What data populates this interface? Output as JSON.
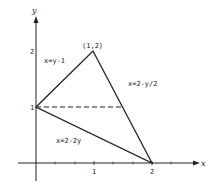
{
  "diagram": {
    "type": "region-plot",
    "axes": {
      "x_label": "x",
      "y_label": "y",
      "x_ticks": [
        "1",
        "2"
      ],
      "y_ticks": [
        "1",
        "2"
      ]
    },
    "vertices": {
      "apex": {
        "label": "(1,2)",
        "x": 1,
        "y": 2
      },
      "left": {
        "x": 0,
        "y": 1
      },
      "right": {
        "x": 2,
        "y": 0
      }
    },
    "curves": [
      {
        "label": "x=y-1",
        "from": [
          0,
          1
        ],
        "to": [
          1,
          2
        ]
      },
      {
        "label": "x=2-y/2",
        "from": [
          1,
          2
        ],
        "to": [
          2,
          0
        ]
      },
      {
        "label": "x=2-2y",
        "from": [
          0,
          1
        ],
        "to": [
          2,
          0
        ]
      }
    ],
    "dashed_line": {
      "y": 1,
      "x_from": 0,
      "x_to": 1.5
    },
    "colors": {
      "line": "#222222",
      "background": "#ffffff"
    }
  }
}
